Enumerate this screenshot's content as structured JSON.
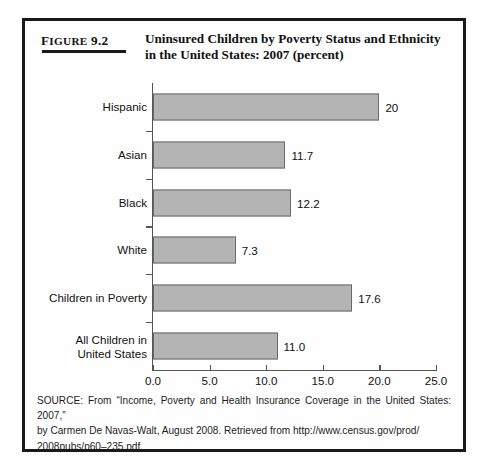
{
  "figure": {
    "number_prefix": "F",
    "number_word": "IGURE",
    "number_value": "9.2",
    "number_full": "FIGURE 9.2",
    "title_line1": "Uninsured Children by Poverty Status and Ethnicity",
    "title_line2": "in the United States: 2007 (percent)"
  },
  "source": {
    "line1": "SOURCE: From “Income, Poverty and Health Insurance Coverage in the United States: 2007,”",
    "line2": "by Carmen De Navas-Walt, August 2008. Retrieved from http://www.census.gov/prod/",
    "line3": "2008pubs/p60–235.pdf."
  },
  "colors": {
    "bar_fill": "#b4b4b4",
    "bar_border": "#6a6a6a",
    "frame": "#1a1a1a",
    "axis": "#555555",
    "text": "#111111"
  },
  "chart_data": {
    "type": "bar",
    "orientation": "horizontal",
    "title": "Uninsured Children by Poverty Status and Ethnicity in the United States: 2007 (percent)",
    "xlabel": "",
    "ylabel": "",
    "xlim": [
      0.0,
      25.0
    ],
    "xticks": [
      "0.0",
      "5.0",
      "10.0",
      "15.0",
      "20.0",
      "25.0"
    ],
    "xtick_values": [
      0.0,
      5.0,
      10.0,
      15.0,
      20.0,
      25.0
    ],
    "grid": false,
    "legend": false,
    "categories": [
      "Hispanic",
      "Asian",
      "Black",
      "White",
      "Children in Poverty",
      "All Children in United States"
    ],
    "category_lines": [
      [
        "Hispanic"
      ],
      [
        "Asian"
      ],
      [
        "Black"
      ],
      [
        "White"
      ],
      [
        "Children in Poverty"
      ],
      [
        "All Children in",
        "United States"
      ]
    ],
    "values": [
      20.0,
      11.7,
      12.2,
      7.3,
      17.6,
      11.0
    ],
    "value_labels": [
      "20",
      "11.7",
      "12.2",
      "7.3",
      "17.6",
      "11.0"
    ]
  }
}
